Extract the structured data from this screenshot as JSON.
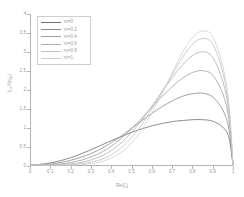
{
  "chart_data": {
    "type": "line",
    "title": "",
    "xlabel": "Re(ζ)",
    "ylabel": "Iₗ,ₘ/I(qₗ,₀)",
    "xlim": [
      0,
      1
    ],
    "ylim": [
      0,
      4
    ],
    "grid": false,
    "legend_position": "top-left",
    "xticks": [
      "0",
      "0.1",
      "0.2",
      "0.3",
      "0.4",
      "0.5",
      "0.6",
      "0.7",
      "0.8",
      "0.9",
      "1"
    ],
    "xtick_values": [
      0,
      0.1,
      0.2,
      0.3,
      0.4,
      0.5,
      0.6,
      0.7,
      0.8,
      0.9,
      1
    ],
    "yticks": [
      "0",
      "0.5",
      "1",
      "1.5",
      "2",
      "2.5",
      "3",
      "3.5",
      "4"
    ],
    "ytick_values": [
      0,
      0.5,
      1,
      1.5,
      2,
      2.5,
      3,
      3.5,
      4
    ],
    "x": [
      0,
      0.05,
      0.1,
      0.15,
      0.2,
      0.25,
      0.3,
      0.35,
      0.4,
      0.45,
      0.5,
      0.55,
      0.6,
      0.65,
      0.7,
      0.75,
      0.8,
      0.85,
      0.9,
      0.95,
      0.98,
      1
    ],
    "series": [
      {
        "name": "m=0",
        "color": "#6f6f6f",
        "peak_x": 0.82,
        "peak_y": 1.2,
        "values": [
          0,
          0.02,
          0.06,
          0.12,
          0.2,
          0.3,
          0.41,
          0.53,
          0.65,
          0.76,
          0.87,
          0.96,
          1.04,
          1.1,
          1.15,
          1.18,
          1.2,
          1.2,
          1.16,
          1.0,
          0.72,
          0
        ]
      },
      {
        "name": "m=0.2",
        "color": "#8a8a8a",
        "peak_x": 0.83,
        "peak_y": 1.9,
        "values": [
          0,
          0.01,
          0.03,
          0.07,
          0.13,
          0.21,
          0.31,
          0.44,
          0.6,
          0.78,
          0.98,
          1.18,
          1.37,
          1.55,
          1.7,
          1.82,
          1.89,
          1.9,
          1.8,
          1.45,
          0.95,
          0
        ]
      },
      {
        "name": "m=0.4",
        "color": "#9e9e9e",
        "peak_x": 0.84,
        "peak_y": 2.5,
        "values": [
          0,
          0.0,
          0.01,
          0.03,
          0.07,
          0.13,
          0.22,
          0.34,
          0.51,
          0.72,
          0.97,
          1.25,
          1.54,
          1.82,
          2.08,
          2.3,
          2.45,
          2.5,
          2.38,
          1.88,
          1.2,
          0
        ]
      },
      {
        "name": "m=0.6",
        "color": "#b0b0b0",
        "peak_x": 0.85,
        "peak_y": 3.0,
        "values": [
          0,
          0.0,
          0.0,
          0.01,
          0.03,
          0.07,
          0.14,
          0.24,
          0.39,
          0.6,
          0.88,
          1.2,
          1.57,
          1.95,
          2.32,
          2.65,
          2.9,
          3.0,
          2.85,
          2.2,
          1.38,
          0
        ]
      },
      {
        "name": "m=0.8",
        "color": "#c0c0c0",
        "peak_x": 0.855,
        "peak_y": 3.35,
        "values": [
          0,
          0.0,
          0.0,
          0.0,
          0.01,
          0.03,
          0.08,
          0.15,
          0.28,
          0.47,
          0.74,
          1.08,
          1.5,
          1.95,
          2.4,
          2.85,
          3.2,
          3.35,
          3.2,
          2.45,
          1.5,
          0
        ]
      },
      {
        "name": "m=1",
        "color": "#cfcfcf",
        "peak_x": 0.86,
        "peak_y": 3.55,
        "values": [
          0,
          0.0,
          0.0,
          0.0,
          0.0,
          0.01,
          0.04,
          0.09,
          0.19,
          0.35,
          0.6,
          0.95,
          1.4,
          1.9,
          2.45,
          2.98,
          3.38,
          3.55,
          3.4,
          2.6,
          1.6,
          0
        ]
      }
    ]
  }
}
